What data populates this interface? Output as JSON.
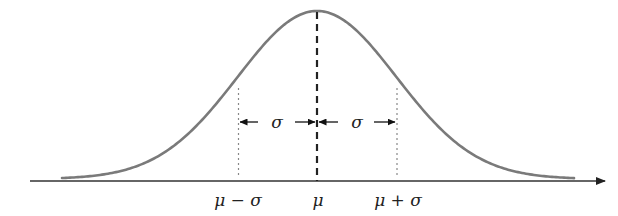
{
  "diagram": {
    "axis": {
      "has_arrow": true,
      "color": "#333333"
    },
    "curve": {
      "type": "gaussian",
      "color": "#7a7a7a"
    },
    "mean_line": {
      "style": "dashed",
      "color": "#222222"
    },
    "sigma_lines": {
      "style": "dotted",
      "color": "#888888"
    },
    "x_labels": {
      "left": "μ − σ",
      "center": "μ",
      "right": "μ + σ"
    },
    "sigma_arrows": {
      "left_label": "σ",
      "right_label": "σ"
    }
  }
}
